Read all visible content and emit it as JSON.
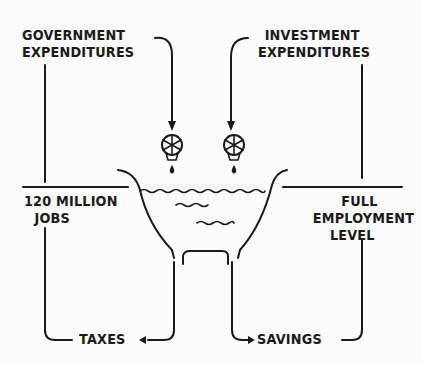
{
  "diagram": {
    "type": "flow illustration (bathtub economy model)",
    "inflows": [
      {
        "id": "government",
        "line1": "Government",
        "line2": "Expenditures"
      },
      {
        "id": "investment",
        "line1": "Investment",
        "line2": "Expenditures"
      }
    ],
    "levels": {
      "left": {
        "line1": "120 Million",
        "line2": "Jobs"
      },
      "right": {
        "line1": "Full",
        "line2": "Employment",
        "line3": "Level"
      }
    },
    "outflows": [
      {
        "id": "taxes",
        "label": "Taxes"
      },
      {
        "id": "savings",
        "label": "Savings"
      }
    ],
    "colors": {
      "ink": "#1a1a1a",
      "paper": "#fbfbfb"
    }
  }
}
